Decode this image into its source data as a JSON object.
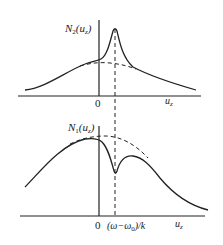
{
  "figure": {
    "top_panel": {
      "ylabel_main": "N",
      "ylabel_sub": "2",
      "ylabel_arg": "(u",
      "ylabel_arg_sub": "z",
      "ylabel_close": ")",
      "origin_label": "0",
      "xlabel_main": "u",
      "xlabel_sub": "z",
      "feature": "peak"
    },
    "bottom_panel": {
      "ylabel_main": "N",
      "ylabel_sub": "1",
      "ylabel_arg": "(u",
      "ylabel_arg_sub": "z",
      "ylabel_close": ")",
      "origin_label": "0",
      "marker_label": "(ω−ω",
      "marker_label_sub": "0",
      "marker_label_end": ")/k",
      "xlabel_main": "u",
      "xlabel_sub": "z",
      "feature": "dip"
    },
    "colors": {
      "line": "#222222",
      "background": "#ffffff"
    }
  }
}
